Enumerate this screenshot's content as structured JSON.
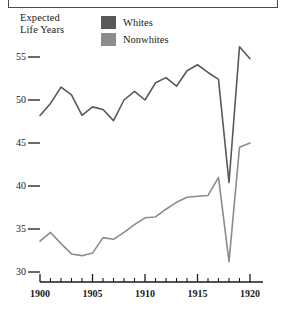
{
  "figure": {
    "axis_title": "Expected\nLife Years",
    "series_color_whites": "#595959",
    "series_color_nonwhites": "#8c8c8c",
    "axis_color": "#1a1a1a",
    "frame_color": "#4a4a4a",
    "background": "#ffffff"
  },
  "legend": {
    "position": "top-center",
    "items": [
      {
        "label": "Whites",
        "swatch": "#595959",
        "icon": "color-swatch-icon"
      },
      {
        "label": "Nonwhites",
        "swatch": "#8c8c8c",
        "icon": "color-swatch-icon"
      }
    ]
  },
  "chart_data": {
    "type": "line",
    "title": "",
    "subtitle": "",
    "xlabel": "",
    "ylabel": "Expected Life Years",
    "xlim": [
      1900,
      1920
    ],
    "ylim": [
      30,
      56.5
    ],
    "grid": false,
    "legend_position": "top-center",
    "x": [
      1900,
      1901,
      1902,
      1903,
      1904,
      1905,
      1906,
      1907,
      1908,
      1909,
      1910,
      1911,
      1912,
      1913,
      1914,
      1915,
      1916,
      1917,
      1918,
      1919,
      1920
    ],
    "yticks": [
      30,
      35,
      40,
      45,
      50,
      55
    ],
    "yticklabels": [
      "30",
      "35",
      "40",
      "45",
      "50",
      "55"
    ],
    "xticks_major": [
      1900,
      1905,
      1910,
      1915,
      1920
    ],
    "xticklabels_major": [
      "1900",
      "1905",
      "1910",
      "1915",
      "1920"
    ],
    "xticks_minor": [
      1901,
      1902,
      1903,
      1904,
      1906,
      1907,
      1908,
      1909,
      1911,
      1912,
      1913,
      1914,
      1916,
      1917,
      1918,
      1919
    ],
    "series": [
      {
        "name": "Whites",
        "color": "#595959",
        "values": [
          48.2,
          49.6,
          51.5,
          50.6,
          48.2,
          49.2,
          48.9,
          47.6,
          50.0,
          51.0,
          50.0,
          52.0,
          52.6,
          51.6,
          53.4,
          54.1,
          53.2,
          52.4,
          40.4,
          56.2,
          54.8
        ]
      },
      {
        "name": "Nonwhites",
        "color": "#8c8c8c",
        "values": [
          33.6,
          34.6,
          33.3,
          32.1,
          31.9,
          32.2,
          34.0,
          33.8,
          34.6,
          35.5,
          36.3,
          36.4,
          37.3,
          38.1,
          38.7,
          38.8,
          38.9,
          41.0,
          31.2,
          44.5,
          45.0
        ]
      }
    ]
  }
}
